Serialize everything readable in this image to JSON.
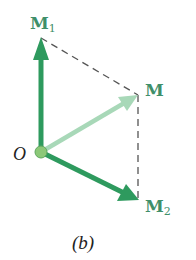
{
  "figure": {
    "caption": "(b)",
    "origin_label": "O",
    "vectors": [
      {
        "name": "M1",
        "label_main": "M",
        "label_sub": "1",
        "color": "#2e9a5e"
      },
      {
        "name": "M",
        "label_main": "M",
        "label_sub": "",
        "color": "#9fd3b0"
      },
      {
        "name": "M2",
        "label_main": "M",
        "label_sub": "2",
        "color": "#2e9a5e"
      }
    ],
    "dashed_line_color": "#555555",
    "origin_dot_color": "#8cc878"
  }
}
